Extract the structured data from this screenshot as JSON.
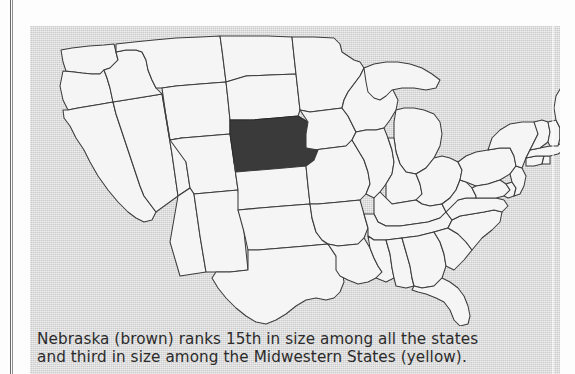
{
  "figure": {
    "kind": "map",
    "panel_background_hex": "#d9d9d9",
    "state_fill_hex": "#f5f5f5",
    "state_outline_hex": "#3c3c3c",
    "highlight_state": "Nebraska",
    "highlight_fill_hex": "#3a3a3a",
    "water_fill_hex": "#d9d9d9",
    "caption": {
      "line1": "Nebraska (brown) ranks 15th in size among all the states",
      "line2": "and third in size among the Midwestern States (yellow)."
    },
    "legend_terms": {
      "highlighted_color_word": "brown",
      "region_color_word": "yellow"
    },
    "facts": {
      "rank_all_states": "15th",
      "rank_midwestern_states": "third",
      "region": "Midwestern States"
    }
  },
  "map_data": {
    "type": "choropleth",
    "projection_note": "simplified conterminous United States outline",
    "highlighted": [
      "Nebraska"
    ],
    "features_depicted": [
      "Washington",
      "Oregon",
      "California",
      "Nevada",
      "Idaho",
      "Montana",
      "Wyoming",
      "Utah",
      "Arizona",
      "New Mexico",
      "Colorado",
      "North Dakota",
      "South Dakota",
      "Nebraska",
      "Kansas",
      "Oklahoma",
      "Texas",
      "Minnesota",
      "Iowa",
      "Missouri",
      "Arkansas",
      "Louisiana",
      "Wisconsin",
      "Illinois",
      "Michigan",
      "Indiana",
      "Ohio",
      "Kentucky",
      "Tennessee",
      "Mississippi",
      "Alabama",
      "Georgia",
      "Florida",
      "South Carolina",
      "North Carolina",
      "Virginia",
      "West Virginia",
      "Maryland",
      "Delaware",
      "Pennsylvania",
      "New Jersey",
      "New York",
      "Connecticut",
      "Rhode Island",
      "Massachusetts",
      "Vermont",
      "New Hampshire",
      "Maine"
    ],
    "water_features_depicted": [
      "Lake Superior",
      "Lake Michigan",
      "Lake Huron",
      "Lake Erie",
      "Lake Ontario"
    ]
  }
}
